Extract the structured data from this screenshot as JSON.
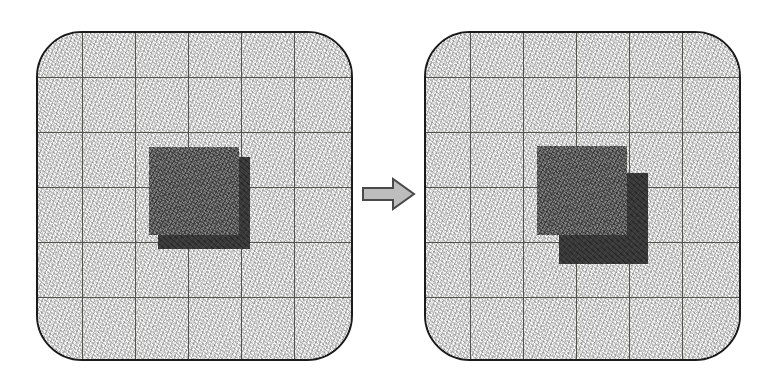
{
  "figure": {
    "type": "before-after-transformation-diagram",
    "title": "",
    "caption": "",
    "panel_count": 2,
    "background_color": "#ffffff"
  },
  "colors": {
    "panel_border": "#1b1b1b",
    "panel_fill": "#dedede",
    "grid_line": "#54544f",
    "square_front": "#6d6d6d",
    "square_back": "#3a3a3a",
    "arrow_fill": "#bdbdbd",
    "arrow_outline": "#4a4a4a"
  },
  "panels": [
    {
      "id": "panel-before",
      "label": "before",
      "frame": {
        "x": 36,
        "y": 31,
        "width": 317,
        "height": 330,
        "corner_radius": 46
      },
      "grid": {
        "columns": 6,
        "rows": 6,
        "vertical_lines": [
          80,
          133,
          186,
          239,
          292
        ],
        "horizontal_lines": [
          75,
          130,
          185,
          240,
          295
        ]
      },
      "shapes": [
        {
          "id": "back-square",
          "name": "dark-square",
          "color": "#3a3a3a",
          "x": 156,
          "y": 155,
          "width": 92,
          "height": 92,
          "z": 1
        },
        {
          "id": "front-square",
          "name": "gray-square",
          "color": "#6d6d6d",
          "x": 147,
          "y": 145,
          "width": 90,
          "height": 88,
          "z": 2
        }
      ],
      "offset": {
        "dx": 9,
        "dy": 10,
        "description": "back square offset down-right by a small amount"
      }
    },
    {
      "id": "panel-after",
      "label": "after",
      "frame": {
        "x": 424,
        "y": 31,
        "width": 317,
        "height": 330,
        "corner_radius": 46
      },
      "grid": {
        "columns": 6,
        "rows": 6,
        "vertical_lines": [
          468,
          521,
          574,
          627,
          680
        ],
        "horizontal_lines": [
          75,
          130,
          185,
          240,
          295
        ]
      },
      "shapes": [
        {
          "id": "back-square",
          "name": "dark-square",
          "color": "#3a3a3a",
          "x": 557,
          "y": 171,
          "width": 89,
          "height": 91,
          "z": 1
        },
        {
          "id": "front-square",
          "name": "gray-square",
          "color": "#6d6d6d",
          "x": 535,
          "y": 144,
          "width": 90,
          "height": 89,
          "z": 2
        }
      ],
      "offset": {
        "dx": 22,
        "dy": 27,
        "description": "back square offset further down-right, revealing more of it"
      }
    }
  ],
  "arrow": {
    "name": "right-arrow",
    "direction": "right",
    "x": 362,
    "y": 177,
    "width": 54,
    "height": 34,
    "fill": "#bdbdbd",
    "outline": "#4a4a4a"
  }
}
